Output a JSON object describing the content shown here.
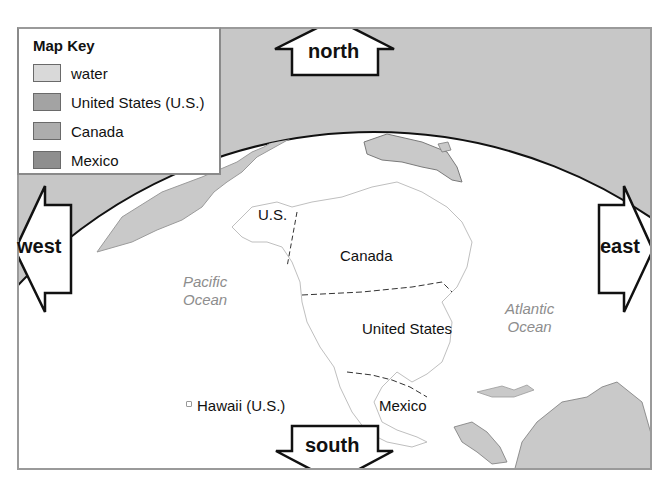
{
  "legend": {
    "title": "Map Key",
    "items": [
      {
        "label": "water",
        "color": "#d9d9d9"
      },
      {
        "label": "United States (U.S.)",
        "color": "#a3a3a3"
      },
      {
        "label": "Canada",
        "color": "#adadad"
      },
      {
        "label": "Mexico",
        "color": "#8e8e8e"
      }
    ]
  },
  "compass": {
    "north": "north",
    "south": "south",
    "east": "east",
    "west": "west"
  },
  "labels": {
    "us_alaska": "U.S.",
    "canada": "Canada",
    "united_states": "United States",
    "mexico": "Mexico",
    "hawaii": "Hawaii (U.S.)"
  },
  "oceans": {
    "pacific_line1": "Pacific",
    "pacific_line2": "Ocean",
    "atlantic_line1": "Atlantic",
    "atlantic_line2": "Ocean"
  },
  "colors": {
    "space": "#c7c7c7",
    "globe": "#ffffff",
    "land_other": "#c9c9c9",
    "outline": "#111111"
  }
}
